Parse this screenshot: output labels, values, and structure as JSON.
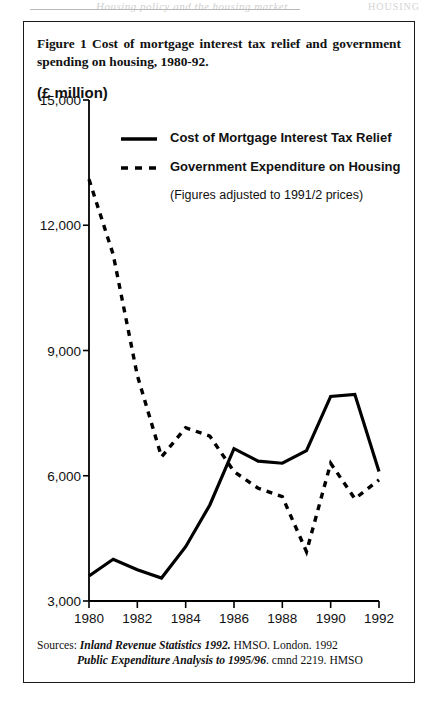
{
  "page_header": {
    "ghost_text": "Housing policy and the housing market",
    "folio": "HOUSING"
  },
  "figure": {
    "caption": "Figure 1 Cost of mortgage interest tax relief and government spending on housing, 1980-92.",
    "unit_label": "(£ million)"
  },
  "legend": {
    "items": [
      {
        "label": "Cost of Mortgage Interest Tax Relief",
        "style": "solid",
        "color": "#000000"
      },
      {
        "label": "Government Expenditure on Housing",
        "style": "dashed",
        "color": "#000000"
      }
    ],
    "note": "(Figures adjusted to 1991/2 prices)"
  },
  "sources": {
    "prefix": "Sources:",
    "line1_title": "Inland Revenue Statistics 1992.",
    "line1_rest": "HMSO. London. 1992",
    "line2_title": "Public Expenditure Analysis to 1995/96",
    "line2_rest": ". cmnd 2219. HMSO"
  },
  "chart_data": {
    "type": "line",
    "title": "Cost of mortgage interest tax relief and government spending on housing, 1980-92.",
    "xlabel": "",
    "ylabel": "(£ million)",
    "x": [
      1980,
      1981,
      1982,
      1983,
      1984,
      1985,
      1986,
      1987,
      1988,
      1989,
      1990,
      1991,
      1992
    ],
    "xlim": [
      1980,
      1992
    ],
    "ylim": [
      3000,
      15000
    ],
    "xticks": [
      1980,
      1982,
      1984,
      1986,
      1988,
      1990,
      1992
    ],
    "xtick_labels": [
      "1980",
      "1982",
      "1984",
      "1986",
      "1988",
      "1990",
      "1992"
    ],
    "yticks": [
      3000,
      6000,
      9000,
      12000,
      15000
    ],
    "ytick_labels": [
      "3,000",
      "6,000",
      "9,000",
      "12,000",
      "15,000"
    ],
    "grid": false,
    "legend_position": "upper-left-inside",
    "annotations": [
      "(Figures adjusted to 1991/2 prices)"
    ],
    "series": [
      {
        "name": "Cost of Mortgage Interest Tax Relief",
        "style": "solid",
        "color": "#000000",
        "values": [
          3600,
          4000,
          3750,
          3550,
          4300,
          5300,
          6650,
          6350,
          6300,
          6600,
          7900,
          7950,
          6100
        ]
      },
      {
        "name": "Government Expenditure on Housing",
        "style": "dashed",
        "color": "#000000",
        "values": [
          13100,
          11300,
          8400,
          6450,
          7150,
          6950,
          6100,
          5700,
          5500,
          4180,
          6300,
          5450,
          5900
        ]
      }
    ]
  }
}
